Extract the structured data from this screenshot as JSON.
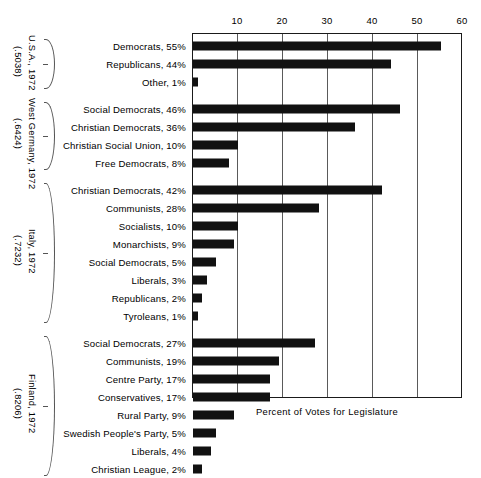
{
  "chart_data": {
    "type": "bar",
    "orientation": "horizontal",
    "title": "",
    "xlabel": "Percent of Votes for Legislature",
    "ylabel": "",
    "xlim": [
      0,
      60
    ],
    "xticks": [
      10,
      20,
      30,
      40,
      50,
      60
    ],
    "grid": true,
    "legend": null,
    "bar_color": "#111111",
    "groups": [
      {
        "country": "U.S.A., 1972",
        "index": "(.5038)",
        "categories": [
          "Democrats, 55%",
          "Republicans, 44%",
          "Other, 1%"
        ],
        "parties": [
          "Democrats",
          "Republicans",
          "Other"
        ],
        "values": [
          55,
          44,
          1
        ]
      },
      {
        "country": "West Germany, 1972",
        "index": "(.6424)",
        "categories": [
          "Social Democrats, 46%",
          "Christian Democrats, 36%",
          "Christian Social Union, 10%",
          "Free Democrats, 8%"
        ],
        "parties": [
          "Social Democrats",
          "Christian Democrats",
          "Christian Social Union",
          "Free Democrats"
        ],
        "values": [
          46,
          36,
          10,
          8
        ]
      },
      {
        "country": "Italy, 1972",
        "index": "(.7232)",
        "categories": [
          "Christian Democrats, 42%",
          "Communists, 28%",
          "Socialists, 10%",
          "Monarchists, 9%",
          "Social Democrats, 5%",
          "Liberals, 3%",
          "Republicans, 2%",
          "Tyroleans, 1%"
        ],
        "parties": [
          "Christian Democrats",
          "Communists",
          "Socialists",
          "Monarchists",
          "Social Democrats",
          "Liberals",
          "Republicans",
          "Tyroleans"
        ],
        "values": [
          42,
          28,
          10,
          9,
          5,
          3,
          2,
          1
        ]
      },
      {
        "country": "Finland, 1972",
        "index": "(.8206)",
        "categories": [
          "Social Democrats, 27%",
          "Communists, 19%",
          "Centre Party, 17%",
          "Conservatives, 17%",
          "Rural Party, 9%",
          "Swedish People's Party, 5%",
          "Liberals, 4%",
          "Christian League, 2%"
        ],
        "parties": [
          "Social Democrats",
          "Communists",
          "Centre Party",
          "Conservatives",
          "Rural Party",
          "Swedish People's Party",
          "Liberals",
          "Christian League"
        ],
        "values": [
          27,
          19,
          17,
          17,
          9,
          5,
          4,
          2
        ]
      }
    ]
  }
}
